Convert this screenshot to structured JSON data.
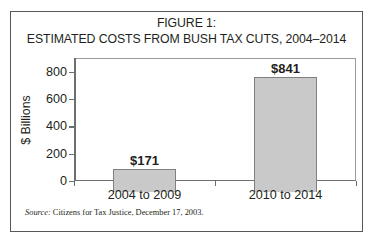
{
  "figure": {
    "title_line1": "FIGURE 1:",
    "title_line2": "ESTIMATED COSTS FROM BUSH TAX CUTS, 2004–2014",
    "source_label": "Source:",
    "source_text": " Citizens for Tax Justice, December 17, 2003."
  },
  "chart_data": {
    "type": "bar",
    "title": "FIGURE 1: ESTIMATED COSTS FROM BUSH TAX CUTS, 2004–2014",
    "categories": [
      "2004 to 2009",
      "2010 to 2014"
    ],
    "values": [
      171,
      841
    ],
    "data_labels": [
      "$171",
      "$841"
    ],
    "xlabel": "",
    "ylabel": "$ Billions",
    "ylim": [
      0,
      900
    ],
    "yticks": [
      0,
      200,
      400,
      600,
      800
    ],
    "ytick_labels": [
      "0",
      "200",
      "400",
      "600",
      "800"
    ],
    "grid": false,
    "legend": "none",
    "bar_fill_color": "#c9c9c9",
    "bar_border_color": "#808082",
    "axis_color": "#6d6e70",
    "text_color": "#231f20"
  }
}
